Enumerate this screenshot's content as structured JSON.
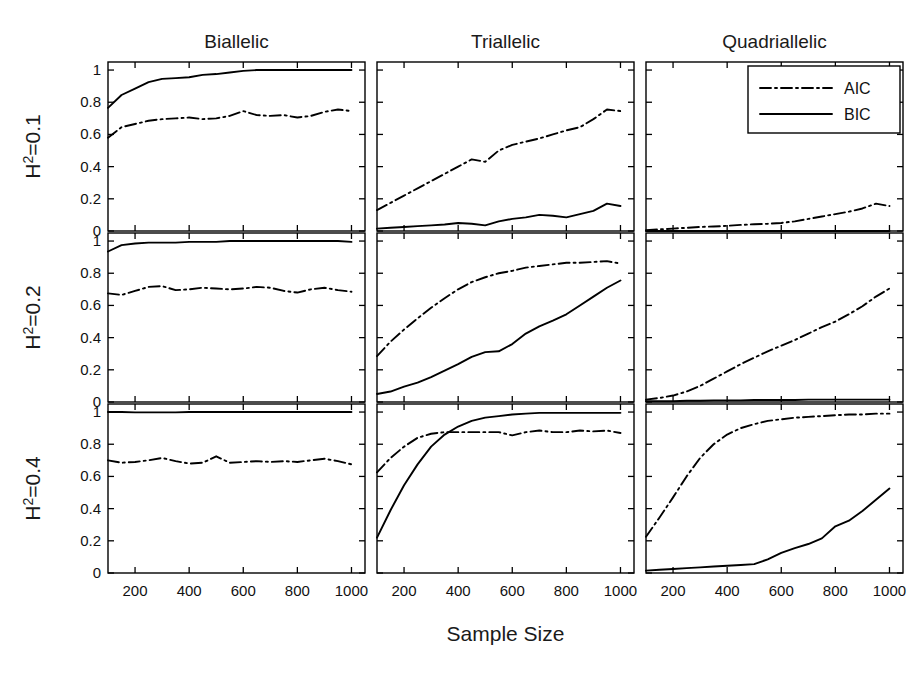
{
  "figure": {
    "xlabel": "Sample Size",
    "col_titles": [
      "Biallelic",
      "Triallelic",
      "Quadriallelic"
    ],
    "row_labels": [
      {
        "base": "H",
        "sup": "2",
        "rest": "=0.1"
      },
      {
        "base": "H",
        "sup": "2",
        "rest": "=0.2"
      },
      {
        "base": "H",
        "sup": "2",
        "rest": "=0.4"
      }
    ],
    "legend": {
      "position": "top-right-of-panel-1-3",
      "entries": [
        {
          "label": "AIC",
          "style": "dash-dot"
        },
        {
          "label": "BIC",
          "style": "solid"
        }
      ]
    }
  },
  "chart_data": {
    "type": "line",
    "title": "",
    "xlabel": "Sample Size",
    "ylabel": "",
    "xlim": [
      100,
      1050
    ],
    "ylim": [
      0,
      1.05
    ],
    "xticks": [
      200,
      400,
      600,
      800,
      1000
    ],
    "xticklabels": [
      "200",
      "400",
      "600",
      "800",
      "1000"
    ],
    "yticks": [
      0,
      0.2,
      0.4,
      0.6,
      0.8,
      1
    ],
    "yticklabels": [
      "0",
      "0.2",
      "0.4",
      "0.6",
      "0.8",
      "1"
    ],
    "grid": false,
    "legend_entries": [
      "AIC",
      "BIC"
    ],
    "x": [
      100,
      150,
      200,
      250,
      300,
      350,
      400,
      450,
      500,
      550,
      600,
      650,
      700,
      750,
      800,
      850,
      900,
      950,
      1000
    ],
    "panels": [
      {
        "row": 0,
        "col": 0,
        "row_label": "H2=0.1",
        "col_title": "Biallelic",
        "series": [
          {
            "name": "AIC",
            "style": "dash-dot",
            "values": [
              0.58,
              0.645,
              0.665,
              0.685,
              0.695,
              0.7,
              0.705,
              0.695,
              0.7,
              0.715,
              0.745,
              0.72,
              0.715,
              0.72,
              0.705,
              0.715,
              0.74,
              0.755,
              0.745
            ]
          },
          {
            "name": "BIC",
            "style": "solid",
            "values": [
              0.765,
              0.845,
              0.885,
              0.925,
              0.945,
              0.95,
              0.955,
              0.97,
              0.975,
              0.985,
              0.995,
              1.0,
              1.0,
              1.0,
              1.0,
              1.0,
              1.0,
              1.0,
              1.0
            ]
          }
        ]
      },
      {
        "row": 0,
        "col": 1,
        "row_label": "H2=0.1",
        "col_title": "Triallelic",
        "series": [
          {
            "name": "AIC",
            "style": "dash-dot",
            "values": [
              0.13,
              0.175,
              0.22,
              0.265,
              0.31,
              0.355,
              0.4,
              0.445,
              0.43,
              0.5,
              0.535,
              0.555,
              0.575,
              0.6,
              0.625,
              0.645,
              0.695,
              0.755,
              0.745
            ]
          },
          {
            "name": "BIC",
            "style": "solid",
            "values": [
              0.015,
              0.02,
              0.025,
              0.03,
              0.035,
              0.04,
              0.05,
              0.045,
              0.035,
              0.06,
              0.075,
              0.085,
              0.1,
              0.095,
              0.085,
              0.105,
              0.125,
              0.17,
              0.155
            ]
          }
        ]
      },
      {
        "row": 0,
        "col": 2,
        "row_label": "H2=0.1",
        "col_title": "Quadriallelic",
        "series": [
          {
            "name": "AIC",
            "style": "dash-dot",
            "values": [
              0.005,
              0.01,
              0.015,
              0.02,
              0.025,
              0.028,
              0.032,
              0.038,
              0.042,
              0.045,
              0.05,
              0.06,
              0.075,
              0.09,
              0.105,
              0.12,
              0.14,
              0.17,
              0.155
            ]
          },
          {
            "name": "BIC",
            "style": "solid",
            "values": [
              0.0,
              0.0,
              0.0,
              0.0,
              0.0,
              0.0,
              0.0,
              0.0,
              0.0,
              0.0,
              0.0,
              0.0,
              0.0,
              0.0,
              0.0,
              0.0,
              0.0,
              0.0,
              0.0
            ]
          }
        ]
      },
      {
        "row": 1,
        "col": 0,
        "row_label": "H2=0.2",
        "col_title": "Biallelic",
        "series": [
          {
            "name": "AIC",
            "style": "dash-dot",
            "values": [
              0.675,
              0.665,
              0.69,
              0.715,
              0.72,
              0.695,
              0.7,
              0.71,
              0.705,
              0.7,
              0.705,
              0.715,
              0.71,
              0.69,
              0.68,
              0.7,
              0.71,
              0.695,
              0.685
            ]
          },
          {
            "name": "BIC",
            "style": "solid",
            "values": [
              0.935,
              0.975,
              0.985,
              0.99,
              0.99,
              0.99,
              0.995,
              0.995,
              0.995,
              1.0,
              1.0,
              1.0,
              1.0,
              1.0,
              1.0,
              1.0,
              1.0,
              1.0,
              0.995
            ]
          }
        ]
      },
      {
        "row": 1,
        "col": 1,
        "row_label": "H2=0.2",
        "col_title": "Triallelic",
        "series": [
          {
            "name": "AIC",
            "style": "dash-dot",
            "values": [
              0.285,
              0.375,
              0.45,
              0.52,
              0.585,
              0.645,
              0.7,
              0.745,
              0.775,
              0.8,
              0.815,
              0.835,
              0.845,
              0.855,
              0.865,
              0.865,
              0.87,
              0.875,
              0.86
            ]
          },
          {
            "name": "BIC",
            "style": "solid",
            "values": [
              0.05,
              0.065,
              0.095,
              0.12,
              0.155,
              0.195,
              0.235,
              0.28,
              0.31,
              0.315,
              0.36,
              0.425,
              0.47,
              0.505,
              0.545,
              0.6,
              0.655,
              0.71,
              0.755
            ]
          }
        ]
      },
      {
        "row": 1,
        "col": 2,
        "row_label": "H2=0.2",
        "col_title": "Quadriallelic",
        "series": [
          {
            "name": "AIC",
            "style": "dash-dot",
            "values": [
              0.015,
              0.025,
              0.04,
              0.065,
              0.1,
              0.145,
              0.19,
              0.235,
              0.275,
              0.315,
              0.35,
              0.385,
              0.425,
              0.465,
              0.5,
              0.545,
              0.595,
              0.655,
              0.705
            ]
          },
          {
            "name": "BIC",
            "style": "solid",
            "values": [
              0.005,
              0.005,
              0.005,
              0.008,
              0.008,
              0.01,
              0.01,
              0.01,
              0.012,
              0.012,
              0.012,
              0.012,
              0.015,
              0.015,
              0.015,
              0.015,
              0.015,
              0.015,
              0.015
            ]
          }
        ]
      },
      {
        "row": 2,
        "col": 0,
        "row_label": "H2=0.4",
        "col_title": "Biallelic",
        "series": [
          {
            "name": "AIC",
            "style": "dash-dot",
            "values": [
              0.7,
              0.685,
              0.69,
              0.7,
              0.715,
              0.695,
              0.68,
              0.685,
              0.725,
              0.685,
              0.69,
              0.695,
              0.69,
              0.695,
              0.69,
              0.7,
              0.71,
              0.695,
              0.675
            ]
          },
          {
            "name": "BIC",
            "style": "solid",
            "values": [
              1.0,
              1.0,
              0.998,
              0.998,
              0.998,
              0.998,
              1.0,
              1.0,
              1.0,
              1.0,
              1.0,
              1.0,
              1.0,
              1.0,
              1.0,
              1.0,
              1.0,
              1.0,
              1.0
            ]
          }
        ]
      },
      {
        "row": 2,
        "col": 1,
        "row_label": "H2=0.4",
        "col_title": "Triallelic",
        "series": [
          {
            "name": "AIC",
            "style": "dash-dot",
            "values": [
              0.625,
              0.715,
              0.785,
              0.84,
              0.865,
              0.875,
              0.875,
              0.875,
              0.875,
              0.875,
              0.855,
              0.875,
              0.885,
              0.875,
              0.875,
              0.885,
              0.88,
              0.885,
              0.87
            ]
          },
          {
            "name": "BIC",
            "style": "solid",
            "values": [
              0.22,
              0.39,
              0.545,
              0.675,
              0.785,
              0.86,
              0.91,
              0.945,
              0.965,
              0.975,
              0.985,
              0.99,
              0.995,
              0.995,
              0.995,
              0.995,
              0.995,
              0.995,
              0.995
            ]
          }
        ]
      },
      {
        "row": 2,
        "col": 2,
        "row_label": "H2=0.4",
        "col_title": "Quadriallelic",
        "series": [
          {
            "name": "AIC",
            "style": "dash-dot",
            "values": [
              0.225,
              0.345,
              0.47,
              0.6,
              0.715,
              0.8,
              0.86,
              0.9,
              0.925,
              0.945,
              0.955,
              0.965,
              0.97,
              0.975,
              0.98,
              0.985,
              0.985,
              0.99,
              0.99
            ]
          },
          {
            "name": "BIC",
            "style": "solid",
            "values": [
              0.015,
              0.02,
              0.025,
              0.03,
              0.035,
              0.04,
              0.045,
              0.05,
              0.055,
              0.085,
              0.125,
              0.155,
              0.18,
              0.215,
              0.29,
              0.325,
              0.385,
              0.455,
              0.525
            ]
          }
        ]
      }
    ]
  }
}
